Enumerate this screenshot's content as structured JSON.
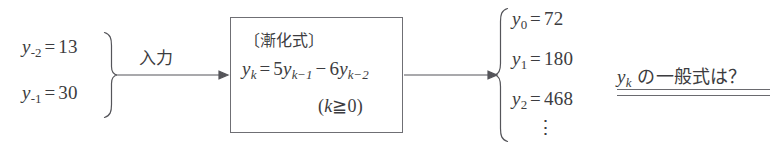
{
  "figure": {
    "type": "flow-diagram",
    "background_color": "#ffffff",
    "ink_color": "#3c3c40"
  },
  "input_group": {
    "brace": "right-curly-brace",
    "items": [
      {
        "lhs_var": "y",
        "lhs_sub": "-2",
        "value": "13",
        "full": "y_-2 = 13"
      },
      {
        "lhs_var": "y",
        "lhs_sub": "-1",
        "value": "30",
        "full": "y_-1 = 30"
      }
    ],
    "arrow_label": "入力"
  },
  "process_box": {
    "title": "〔漸化式〕",
    "equation": {
      "lhs_var": "y",
      "lhs_sub": "k",
      "eq": "=",
      "term1_coef": "5",
      "term1_var": "y",
      "term1_sub": "k−1",
      "operator": "−",
      "term2_coef": "6",
      "term2_var": "y",
      "term2_sub": "k−2",
      "full": "y_k = 5y_{k-1} - 6y_{k-2}"
    },
    "condition": {
      "open": "(",
      "var": "k",
      "relation": "≧",
      "value": "0",
      "close": ")",
      "full": "(k ≧ 0)"
    }
  },
  "output_group": {
    "brace": "left-curly-brace",
    "items": [
      {
        "lhs_var": "y",
        "lhs_sub": "0",
        "value": "72",
        "full": "y_0 = 72"
      },
      {
        "lhs_var": "y",
        "lhs_sub": "1",
        "value": "180",
        "full": "y_1 = 180"
      },
      {
        "lhs_var": "y",
        "lhs_sub": "2",
        "value": "468",
        "full": "y_2 = 468"
      }
    ],
    "continuation": "⋮"
  },
  "question": {
    "var": "y",
    "var_sub": "k",
    "text": "の一般式は？",
    "full": "y_k の一般式は？",
    "underline_style": "double"
  },
  "arrows": [
    {
      "name": "input-arrow",
      "from_x": 118,
      "to_x": 228,
      "y": 75
    },
    {
      "name": "output-arrow",
      "from_x": 404,
      "to_x": 497,
      "y": 75
    }
  ]
}
